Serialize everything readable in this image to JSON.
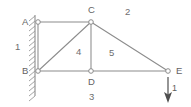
{
  "figure": {
    "type": "structural-truss-diagram",
    "stroke_color": "#8c8c8c",
    "text_color": "#6b6b6b",
    "background_color": "#ffffff"
  },
  "nodes": [
    {
      "id": "A",
      "label": "A",
      "x": 38,
      "y": 22,
      "label_x": 22,
      "label_y": 17,
      "support": "pinned-wall"
    },
    {
      "id": "C",
      "label": "C",
      "x": 91,
      "y": 22,
      "label_x": 88,
      "label_y": 6,
      "support": "free"
    },
    {
      "id": "B",
      "label": "B",
      "x": 38,
      "y": 71,
      "label_x": 22,
      "label_y": 66,
      "support": "pinned-wall"
    },
    {
      "id": "D",
      "label": "D",
      "x": 91,
      "y": 71,
      "label_x": 88,
      "label_y": 77,
      "support": "free"
    },
    {
      "id": "E",
      "label": "E",
      "x": 168,
      "y": 71,
      "label_x": 176,
      "label_y": 66,
      "support": "free"
    }
  ],
  "members": [
    {
      "id": "1",
      "label": "1",
      "from": "A",
      "to": "B",
      "label_x": 15,
      "label_y": 42
    },
    {
      "id": "2",
      "label": "2",
      "from": "A",
      "to": "C",
      "label_x": 125,
      "label_y": 8
    },
    {
      "id": "3",
      "label": "3",
      "from": "B",
      "to": "E",
      "label_x": 89,
      "label_y": 92
    },
    {
      "id": "4",
      "label": "4",
      "from": "B",
      "to": "C",
      "label_x": 76,
      "label_y": 47
    },
    {
      "id": "5",
      "label": "5",
      "from": "C",
      "to": "E",
      "label_x": 109,
      "label_y": 48
    },
    {
      "id": "CD",
      "label": "",
      "from": "C",
      "to": "D",
      "label_x": 0,
      "label_y": 0
    }
  ],
  "wall": {
    "x": 35,
    "y_top": 15,
    "y_bottom": 96,
    "hatch_count": 17,
    "hatch_length": 7
  },
  "load": {
    "label": "1",
    "direction": "down",
    "x": 168,
    "y_start": 77,
    "y_end": 101,
    "label_x": 172,
    "label_y": 85
  }
}
